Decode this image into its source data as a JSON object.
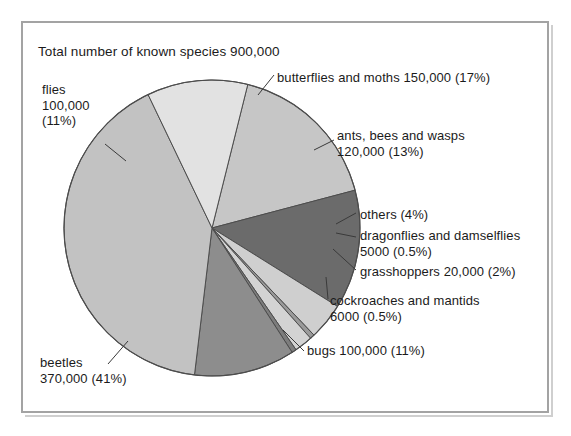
{
  "chart_data": {
    "type": "pie",
    "title": "Total number of known species 900,000",
    "total_label": "900,000",
    "total_value": 900000,
    "xlabel": "",
    "ylabel": "",
    "grid": false,
    "legend_position": "callout-labels",
    "categories": [
      "butterflies and moths",
      "ants, bees and wasps",
      "others",
      "dragonflies and damselflies",
      "grasshoppers",
      "cockroaches and mantids",
      "bugs",
      "beetles",
      "flies"
    ],
    "values": [
      150000,
      120000,
      36000,
      5000,
      20000,
      6000,
      100000,
      370000,
      100000
    ],
    "percents": [
      17,
      13,
      4,
      0.5,
      2,
      0.5,
      11,
      41,
      11
    ],
    "colors": [
      "#c6c6c6",
      "#6b6b6b",
      "#cfcfcf",
      "#9a9a9a",
      "#d3d3d3",
      "#7d7d7d",
      "#8d8d8d",
      "#c2c2c2",
      "#e2e2e2"
    ],
    "slices": [
      {
        "name": "butterflies and moths",
        "value": 150000,
        "percent": 17,
        "color": "#c6c6c6"
      },
      {
        "name": "ants, bees and wasps",
        "value": 120000,
        "percent": 13,
        "color": "#6b6b6b"
      },
      {
        "name": "others",
        "value": 36000,
        "percent": 4,
        "color": "#cfcfcf"
      },
      {
        "name": "dragonflies and damselflies",
        "value": 5000,
        "percent": 0.5,
        "color": "#9a9a9a"
      },
      {
        "name": "grasshoppers",
        "value": 20000,
        "percent": 2,
        "color": "#d3d3d3"
      },
      {
        "name": "cockroaches and mantids",
        "value": 6000,
        "percent": 0.5,
        "color": "#7d7d7d"
      },
      {
        "name": "bugs",
        "value": 100000,
        "percent": 11,
        "color": "#8d8d8d"
      },
      {
        "name": "beetles",
        "value": 370000,
        "percent": 41,
        "color": "#c2c2c2"
      },
      {
        "name": "flies",
        "value": 100000,
        "percent": 11,
        "color": "#e2e2e2"
      }
    ]
  },
  "labels": {
    "butterflies": {
      "line1": "butterflies and moths 150,000 (17%)"
    },
    "ants": {
      "line1": "ants, bees and wasps",
      "line2": "120,000 (13%)"
    },
    "others": {
      "line1": "others (4%)"
    },
    "dragonflies": {
      "line1": "dragonflies and damselflies",
      "line2": "5000 (0.5%)"
    },
    "grasshoppers": {
      "line1": "grasshoppers 20,000 (2%)"
    },
    "cockroaches": {
      "line1": "cockroaches and mantids",
      "line2": "6000 (0.5%)"
    },
    "bugs": {
      "line1": "bugs 100,000 (11%)"
    },
    "beetles": {
      "line1": "beetles",
      "line2": "370,000 (41%)"
    },
    "flies": {
      "line1": "flies",
      "line2": "100,000",
      "line3": "(11%)"
    }
  },
  "style": {
    "frame_border_color": "#a3a3a3",
    "background": "#ffffff",
    "text_color": "#1b1b1b",
    "slice_outline": "#4d4d4d",
    "leader_line": "#3a3a3a"
  }
}
